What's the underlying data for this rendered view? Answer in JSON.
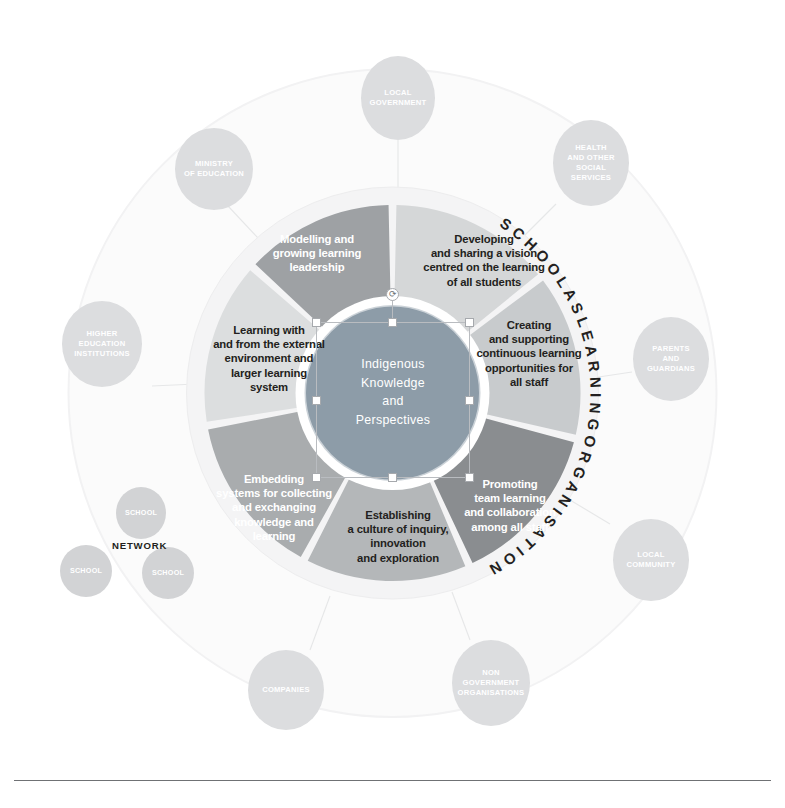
{
  "diagram": {
    "ring_label": "S C H O O L   A S   L E A R N I N G   O R G A N I S A T I O N",
    "centre": {
      "label": "Indigenous\nKnowledge\nand\nPerspectives",
      "color": "#8d9ca8"
    },
    "dimensions": [
      {
        "id": "developing-sharing-vision",
        "label": "Developing\nand sharing a vision\ncentred on the learning\nof all students",
        "color": "#d5d7d8",
        "text_style": "dark"
      },
      {
        "id": "creating-supporting-learning",
        "label": "Creating\nand supporting\ncontinuous learning\nopportunities for\nall staff",
        "color": "#c8cbcd",
        "text_style": "dark"
      },
      {
        "id": "promoting-team-learning",
        "label": "Promoting\nteam learning\nand collaboration\namong all staff",
        "color": "#8a8d90",
        "text_style": "light"
      },
      {
        "id": "establishing-culture-inquiry",
        "label": "Establishing\na culture of inquiry,\ninnovation\nand exploration",
        "color": "#b4b7b9",
        "text_style": "dark"
      },
      {
        "id": "embedding-systems",
        "label": "Embedding\nsystems for collecting\nand exchanging\nknowledge and\nlearning",
        "color": "#a9acae",
        "text_style": "light"
      },
      {
        "id": "learning-external-environment",
        "label": "Learning with\nand from the external\nenvironment and\nlarger learning\nsystem",
        "color": "#dcdedf",
        "text_style": "dark"
      },
      {
        "id": "modelling-growing-leadership",
        "label": "Modelling and\ngrowing learning\nleadership",
        "color": "#9ea1a4",
        "text_style": "light"
      }
    ],
    "stakeholders": [
      {
        "id": "local-government",
        "label": "LOCAL\nGOVERNMENT"
      },
      {
        "id": "health-social-services",
        "label": "HEALTH\nAND OTHER\nSOCIAL\nSERVICES"
      },
      {
        "id": "parents-guardians",
        "label": "PARENTS\nAND\nGUARDIANS"
      },
      {
        "id": "local-community",
        "label": "LOCAL\nCOMMUNITY"
      },
      {
        "id": "non-government-organisations",
        "label": "NON\nGOVERNMENT\nORGANISATIONS"
      },
      {
        "id": "companies",
        "label": "COMPANIES"
      },
      {
        "id": "higher-education-institutions",
        "label": "HIGHER\nEDUCATION\nINSTITUTIONS"
      },
      {
        "id": "ministry-of-education",
        "label": "MINISTRY\nOF EDUCATION"
      }
    ],
    "network": {
      "label": "NETWORK",
      "nodes": [
        {
          "id": "network-school-top",
          "label": "SCHOOL"
        },
        {
          "id": "network-school-left",
          "label": "SCHOOL"
        },
        {
          "id": "network-school-right",
          "label": "SCHOOL"
        }
      ]
    },
    "selection": {
      "rotate_glyph": "⟳"
    }
  }
}
